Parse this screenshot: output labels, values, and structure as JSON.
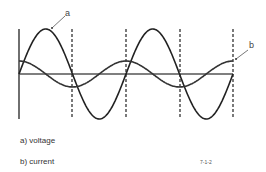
{
  "diagram": {
    "labels": {
      "a": "a",
      "b": "b"
    },
    "colors": {
      "stroke": "#222222",
      "dashed": "#222222",
      "text": "#333333"
    },
    "axis": {
      "x0": 19,
      "y_baseline": 74,
      "y_top": 29,
      "y_bottom": 119,
      "x_end": 233
    },
    "dashed_lines_x": [
      72,
      126,
      180,
      233
    ],
    "series": [
      {
        "name": "a) voltage",
        "type": "sine",
        "amplitude": 45,
        "period_px": 107,
        "phase": 0
      },
      {
        "name": "b) current",
        "type": "cosine",
        "amplitude": 13,
        "period_px": 107,
        "phase": 0
      }
    ]
  },
  "legend": {
    "a": "a) voltage",
    "b": "b) current"
  },
  "figure_ref": "7-1-2"
}
